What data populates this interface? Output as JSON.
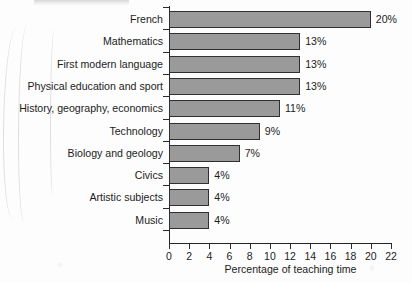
{
  "chart_data": {
    "type": "bar",
    "orientation": "horizontal",
    "title": "",
    "xlabel": "Percentage of teaching time",
    "ylabel": "",
    "xlim": [
      0,
      22
    ],
    "xticks": [
      0,
      2,
      4,
      6,
      8,
      10,
      12,
      14,
      16,
      18,
      20,
      22
    ],
    "xtick_labels": [
      "0",
      "2",
      "4",
      "6",
      "8",
      "10",
      "12",
      "14",
      "16",
      "18",
      "20",
      "22"
    ],
    "grid": false,
    "legend": null,
    "categories": [
      "French",
      "Mathematics",
      "First modern language",
      "Physical education and sport",
      "History, geography, economics",
      "Technology",
      "Biology and geology",
      "Civics",
      "Artistic subjects",
      "Music"
    ],
    "values": [
      20,
      13,
      13,
      13,
      11,
      9,
      7,
      4,
      4,
      4
    ],
    "value_labels": [
      "20%",
      "13%",
      "13%",
      "13%",
      "11%",
      "9%",
      "7%",
      "4%",
      "4%",
      "4%"
    ],
    "bar_fill_color": "#9a9a9a",
    "bar_border_color": "#303030",
    "axis_color": "#262626",
    "text_color": "#1c1c1c",
    "background_color": "#fdfdfd"
  }
}
